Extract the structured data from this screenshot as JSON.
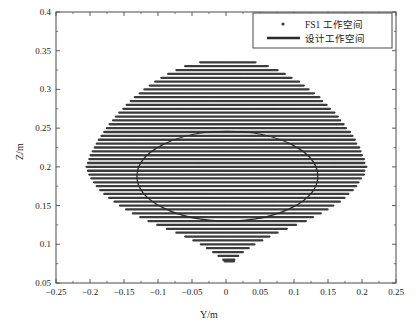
{
  "chart_data": {
    "type": "scatter",
    "title": "",
    "xlabel": "Y/m",
    "ylabel": "Z/m",
    "xlim": [
      -0.25,
      0.25
    ],
    "ylim": [
      0.05,
      0.4
    ],
    "grid": false,
    "xticks": [
      -0.25,
      -0.2,
      -0.15,
      -0.1,
      -0.05,
      0,
      0.05,
      0.1,
      0.15,
      0.2,
      0.25
    ],
    "xtick_labels": [
      "−0.25",
      "−0.2",
      "−0.15",
      "−0.1",
      "−0.05",
      "0",
      "0.05",
      "0.1",
      "0.15",
      "0.2",
      "0.25"
    ],
    "yticks": [
      0.05,
      0.1,
      0.15,
      0.2,
      0.25,
      0.3,
      0.35,
      0.4
    ],
    "ytick_labels": [
      "0.05",
      "0.1",
      "0.15",
      "0.2",
      "0.25",
      "0.3",
      "0.35",
      "0.4"
    ],
    "legend_position": "upper-right",
    "series": [
      {
        "name": "FS1 工作空间",
        "kind": "scatter",
        "marker": "dot",
        "color": "#3c3c3c",
        "description": "Dense horizontal rows of sample points filling a lens/teardrop shaped reachable workspace region.",
        "row_spacing_z": 0.005,
        "point_spacing_y": 0.0025,
        "rows": [
          {
            "z": 0.335,
            "y_min": -0.038,
            "y_max": 0.042
          },
          {
            "z": 0.33,
            "y_min": -0.06,
            "y_max": 0.062
          },
          {
            "z": 0.325,
            "y_min": -0.073,
            "y_max": 0.075
          },
          {
            "z": 0.32,
            "y_min": -0.085,
            "y_max": 0.086
          },
          {
            "z": 0.315,
            "y_min": -0.095,
            "y_max": 0.097
          },
          {
            "z": 0.31,
            "y_min": -0.104,
            "y_max": 0.106
          },
          {
            "z": 0.305,
            "y_min": -0.112,
            "y_max": 0.114
          },
          {
            "z": 0.3,
            "y_min": -0.12,
            "y_max": 0.122
          },
          {
            "z": 0.295,
            "y_min": -0.127,
            "y_max": 0.129
          },
          {
            "z": 0.29,
            "y_min": -0.134,
            "y_max": 0.136
          },
          {
            "z": 0.285,
            "y_min": -0.14,
            "y_max": 0.142
          },
          {
            "z": 0.28,
            "y_min": -0.146,
            "y_max": 0.148
          },
          {
            "z": 0.275,
            "y_min": -0.151,
            "y_max": 0.153
          },
          {
            "z": 0.27,
            "y_min": -0.157,
            "y_max": 0.159
          },
          {
            "z": 0.265,
            "y_min": -0.162,
            "y_max": 0.164
          },
          {
            "z": 0.26,
            "y_min": -0.166,
            "y_max": 0.168
          },
          {
            "z": 0.255,
            "y_min": -0.171,
            "y_max": 0.173
          },
          {
            "z": 0.25,
            "y_min": -0.175,
            "y_max": 0.177
          },
          {
            "z": 0.245,
            "y_min": -0.179,
            "y_max": 0.181
          },
          {
            "z": 0.24,
            "y_min": -0.183,
            "y_max": 0.185
          },
          {
            "z": 0.235,
            "y_min": -0.187,
            "y_max": 0.189
          },
          {
            "z": 0.23,
            "y_min": -0.19,
            "y_max": 0.192
          },
          {
            "z": 0.225,
            "y_min": -0.193,
            "y_max": 0.195
          },
          {
            "z": 0.22,
            "y_min": -0.196,
            "y_max": 0.198
          },
          {
            "z": 0.215,
            "y_min": -0.199,
            "y_max": 0.2
          },
          {
            "z": 0.21,
            "y_min": -0.201,
            "y_max": 0.202
          },
          {
            "z": 0.205,
            "y_min": -0.203,
            "y_max": 0.204
          },
          {
            "z": 0.2,
            "y_min": -0.205,
            "y_max": 0.205
          },
          {
            "z": 0.195,
            "y_min": -0.203,
            "y_max": 0.204
          },
          {
            "z": 0.19,
            "y_min": -0.201,
            "y_max": 0.202
          },
          {
            "z": 0.185,
            "y_min": -0.198,
            "y_max": 0.199
          },
          {
            "z": 0.18,
            "y_min": -0.194,
            "y_max": 0.195
          },
          {
            "z": 0.175,
            "y_min": -0.19,
            "y_max": 0.191
          },
          {
            "z": 0.17,
            "y_min": -0.185,
            "y_max": 0.186
          },
          {
            "z": 0.165,
            "y_min": -0.179,
            "y_max": 0.18
          },
          {
            "z": 0.16,
            "y_min": -0.172,
            "y_max": 0.173
          },
          {
            "z": 0.155,
            "y_min": -0.164,
            "y_max": 0.166
          },
          {
            "z": 0.15,
            "y_min": -0.156,
            "y_max": 0.158
          },
          {
            "z": 0.145,
            "y_min": -0.147,
            "y_max": 0.149
          },
          {
            "z": 0.14,
            "y_min": -0.137,
            "y_max": 0.139
          },
          {
            "z": 0.135,
            "y_min": -0.126,
            "y_max": 0.128
          },
          {
            "z": 0.13,
            "y_min": -0.114,
            "y_max": 0.116
          },
          {
            "z": 0.125,
            "y_min": -0.101,
            "y_max": 0.103
          },
          {
            "z": 0.12,
            "y_min": -0.087,
            "y_max": 0.089
          },
          {
            "z": 0.115,
            "y_min": -0.073,
            "y_max": 0.075
          },
          {
            "z": 0.11,
            "y_min": -0.06,
            "y_max": 0.063
          },
          {
            "z": 0.105,
            "y_min": -0.048,
            "y_max": 0.052
          },
          {
            "z": 0.1,
            "y_min": -0.037,
            "y_max": 0.042
          },
          {
            "z": 0.095,
            "y_min": -0.028,
            "y_max": 0.033
          },
          {
            "z": 0.09,
            "y_min": -0.019,
            "y_max": 0.025
          },
          {
            "z": 0.085,
            "y_min": -0.011,
            "y_max": 0.018
          },
          {
            "z": 0.08,
            "y_min": -0.004,
            "y_max": 0.013
          },
          {
            "z": 0.078,
            "y_min": -0.002,
            "y_max": 0.011
          }
        ]
      },
      {
        "name": "设计工作空间",
        "kind": "line",
        "color": "#2a2a2a",
        "line_width": 1.2,
        "shape": "ellipse",
        "center": [
          0.002,
          0.188
        ],
        "semi_axis_y": 0.133,
        "semi_axis_z": 0.058
      }
    ]
  },
  "legend": {
    "entries": [
      {
        "label": "FS1 工作空间",
        "marker": "dot"
      },
      {
        "label": "设计工作空间",
        "marker": "line"
      }
    ]
  },
  "axes": {
    "x_title": "Y/m",
    "y_title": "Z/m"
  },
  "colors": {
    "scatter": "#3c3c3c",
    "curve": "#2a2a2a",
    "frame": "#4a4a4a",
    "text": "#1a1a1a",
    "background": "#ffffff"
  }
}
